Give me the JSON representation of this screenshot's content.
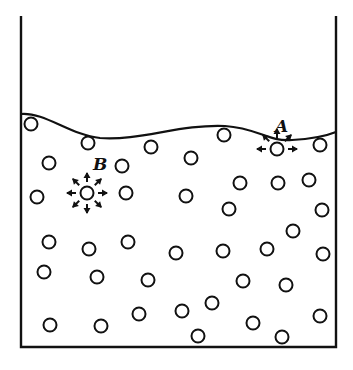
{
  "diagram": {
    "colors": {
      "stroke": "#111111",
      "background": "#ffffff"
    },
    "container": {
      "left": 21,
      "right": 336,
      "top": 16,
      "bottom": 347
    },
    "surface_path": "M21,114 C45,112 70,135 100,138 C140,141 180,124 225,126 C258,128 268,142 292,140 C312,139 326,136 336,132",
    "labels": [
      {
        "id": "A",
        "text": "A",
        "x": 275,
        "y": 132
      },
      {
        "id": "B",
        "text": "B",
        "x": 93,
        "y": 170
      }
    ],
    "molecule_A": {
      "x": 277,
      "y": 149,
      "arrow_dirs": [
        180,
        0,
        135,
        90,
        45
      ]
    },
    "molecule_B": {
      "x": 87,
      "y": 193,
      "arrow_dirs": [
        0,
        45,
        90,
        135,
        180,
        225,
        270,
        315
      ]
    },
    "molecules": [
      [
        31,
        124
      ],
      [
        88,
        143
      ],
      [
        151,
        147
      ],
      [
        224,
        135
      ],
      [
        320,
        145
      ],
      [
        49,
        163
      ],
      [
        122,
        166
      ],
      [
        191,
        158
      ],
      [
        37,
        197
      ],
      [
        126,
        193
      ],
      [
        240,
        183
      ],
      [
        278,
        183
      ],
      [
        309,
        180
      ],
      [
        186,
        196
      ],
      [
        229,
        209
      ],
      [
        322,
        210
      ],
      [
        49,
        242
      ],
      [
        89,
        249
      ],
      [
        128,
        242
      ],
      [
        176,
        253
      ],
      [
        223,
        251
      ],
      [
        267,
        249
      ],
      [
        293,
        231
      ],
      [
        44,
        272
      ],
      [
        97,
        277
      ],
      [
        148,
        280
      ],
      [
        243,
        281
      ],
      [
        286,
        285
      ],
      [
        323,
        254
      ],
      [
        50,
        325
      ],
      [
        101,
        326
      ],
      [
        139,
        314
      ],
      [
        182,
        311
      ],
      [
        212,
        303
      ],
      [
        198,
        336
      ],
      [
        253,
        323
      ],
      [
        282,
        337
      ],
      [
        320,
        316
      ]
    ]
  }
}
